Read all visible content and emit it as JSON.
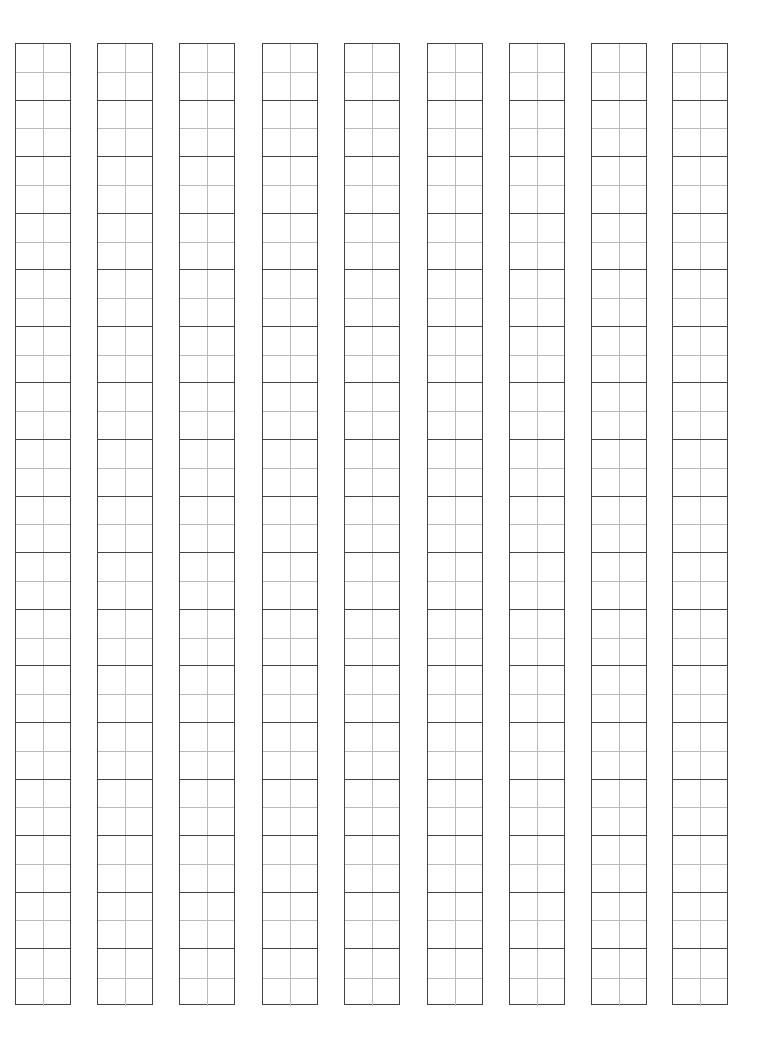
{
  "sheet": {
    "type": "tianzige-practice-grid",
    "columns": 9,
    "cells_per_column": 17,
    "column_left_positions": [
      15,
      97,
      179,
      262,
      344,
      427,
      509,
      591,
      672
    ],
    "colors": {
      "outer_line": "#444444",
      "guide_line": "#bbbbbb",
      "background": "#ffffff"
    }
  }
}
